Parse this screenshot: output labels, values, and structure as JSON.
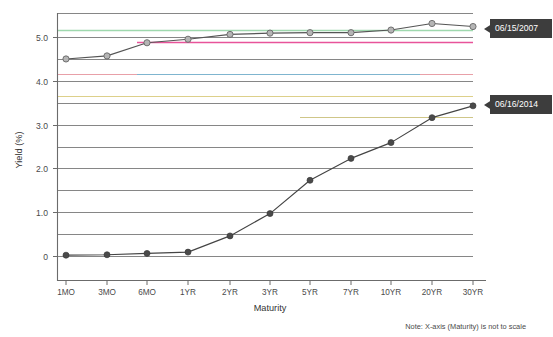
{
  "chart_data": {
    "type": "line",
    "title": "",
    "xlabel": "Maturity",
    "ylabel": "Yield (%)",
    "categories": [
      "1MO",
      "3MO",
      "6MO",
      "1YR",
      "2YR",
      "3YR",
      "5YR",
      "7YR",
      "10YR",
      "20YR",
      "30YR"
    ],
    "ylim": [
      -0.3,
      5.6
    ],
    "yticks": [
      0,
      1.0,
      2.0,
      3.0,
      4.0,
      5.0
    ],
    "ytick_labels": [
      "0",
      "1.0",
      "2.0",
      "3.0",
      "4.0",
      "5.0"
    ],
    "minor_gridlines": [
      0.5,
      1.5,
      2.5,
      3.5,
      4.5,
      5.5
    ],
    "grid": true,
    "legend_position": "right-inline-callout",
    "series": [
      {
        "name": "06/15/2007",
        "color": "#555555",
        "marker": "open-circle",
        "marker_fill": "#b5b5b5",
        "values": [
          4.51,
          4.58,
          4.88,
          4.96,
          5.07,
          5.1,
          5.11,
          5.11,
          5.17,
          5.32,
          5.25
        ]
      },
      {
        "name": "06/16/2014",
        "color": "#444444",
        "marker": "filled-circle",
        "marker_fill": "#4a4a4a",
        "values": [
          0.03,
          0.04,
          0.07,
          0.1,
          0.47,
          0.98,
          1.74,
          2.24,
          2.6,
          3.17,
          3.44
        ]
      }
    ],
    "annotation": "Note: X-axis (Maturity) is not to scale",
    "decor_lines": [
      {
        "y": 5.35,
        "color": "#9fd8ae",
        "name": "green-accent-line"
      },
      {
        "y": 5.08,
        "color": "#e8539a",
        "name": "pink-accent-line"
      },
      {
        "y": 4.0,
        "color": "#e8a0a8",
        "name": "salmon-accent-line"
      },
      {
        "y": 4.0,
        "color": "#5d9fc0",
        "name": "blue-accent-line"
      },
      {
        "y": 3.5,
        "color": "#ddd08a",
        "name": "yellow-accent-line"
      },
      {
        "y": 3.17,
        "color": "#c9c07a",
        "name": "olive-accent-line"
      }
    ]
  },
  "callouts": [
    {
      "label": "06/15/2007",
      "name": "series-callout-2007"
    },
    {
      "label": "06/16/2014",
      "name": "series-callout-2014"
    }
  ],
  "colors": {
    "frame": "#6b6b6b",
    "gridline": "#7a7a7a",
    "callout_bg": "#3d3d3d",
    "callout_text": "#ffffff",
    "background": "#ffffff"
  }
}
